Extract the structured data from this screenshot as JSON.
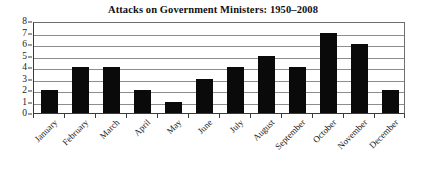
{
  "chart_data": {
    "type": "bar",
    "title": "Attacks on Government Ministers: 1950–2008",
    "xlabel": "",
    "ylabel": "",
    "categories": [
      "January",
      "February",
      "March",
      "April",
      "May",
      "June",
      "July",
      "August",
      "September",
      "October",
      "November",
      "December"
    ],
    "values": [
      2,
      4,
      4,
      2,
      1,
      3,
      4,
      5,
      4,
      7,
      6,
      2
    ],
    "ylim": [
      0,
      8
    ],
    "y_ticks": [
      0,
      1,
      2,
      3,
      4,
      5,
      6,
      7,
      8
    ],
    "y_tick_labels": [
      "0",
      "1",
      "2",
      "3",
      "4",
      "5",
      "6",
      "7",
      "8"
    ],
    "grid": true,
    "grid_axis": "y",
    "legend": false,
    "legend_position": "none",
    "bar_color": "#0a0a0a",
    "grid_color": "#8d8d8d",
    "axis_color": "#3a3a3a",
    "background_color": "#ffffff",
    "title_color": "#111111",
    "x_tick_label_rotation": -45
  }
}
